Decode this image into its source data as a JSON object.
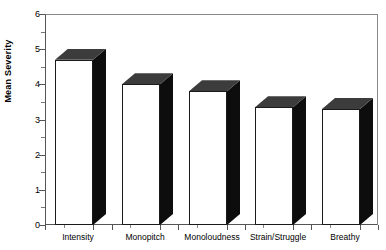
{
  "chart_data": {
    "type": "bar",
    "title": "",
    "subtitle": "",
    "xlabel": "",
    "ylabel": "Mean Severity",
    "categories": [
      "Intensity",
      "Monopitch",
      "Monoloudness",
      "Strain/Struggle",
      "Breathy"
    ],
    "values": [
      4.7,
      4.0,
      3.8,
      3.35,
      3.3
    ],
    "ylim": [
      0,
      6
    ],
    "y_ticks": [
      0,
      1,
      2,
      3,
      4,
      5,
      6
    ],
    "y_tick_labels": [
      "0",
      "1",
      "2",
      "3",
      "4",
      "5",
      "6"
    ],
    "y_minor_ticks": [
      0.5,
      1.5,
      2.5,
      3.5,
      4.5,
      5.5
    ],
    "grid": false,
    "legend": null,
    "style": "3d-bar",
    "colors": {
      "bar_front": "#ffffff",
      "bar_top": "#3c3c3c",
      "bar_side": "#0d0d0d",
      "bar_outline": "#1a1a1a",
      "axis": "#555555",
      "frame": "#8a8a8a",
      "text": "#000000",
      "background": "#ffffff"
    }
  },
  "axis": {
    "y_title": "Mean Severity"
  }
}
